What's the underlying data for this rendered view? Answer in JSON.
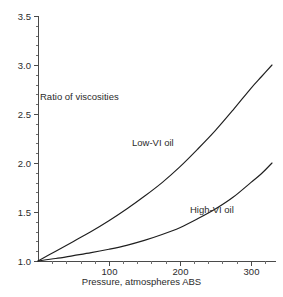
{
  "chart_data": {
    "type": "line",
    "title": "",
    "subtitle": "",
    "xlabel": "Pressure, atmospheres ABS",
    "ylabel": "Ratio of viscosities",
    "xlim": [
      0,
      330
    ],
    "ylim": [
      1.0,
      3.5
    ],
    "grid": false,
    "legend_position": "inline-annotations",
    "x_ticks": [
      100,
      200,
      300
    ],
    "x_tick_labels": [
      "100",
      "200",
      "300"
    ],
    "x_minor_tick_step": 20,
    "y_ticks": [
      1.0,
      1.5,
      2.0,
      2.5,
      3.0,
      3.5
    ],
    "y_tick_labels": [
      "1.0",
      "1.5",
      "2.0",
      "2.5",
      "3.0",
      "3.5"
    ],
    "y_minor_tick_step": 0.1,
    "series": [
      {
        "name": "Low-VI oil",
        "label": "Low-VI oil",
        "color": "#1f1f1f",
        "x": [
          0,
          25,
          50,
          75,
          100,
          125,
          150,
          175,
          200,
          225,
          250,
          275,
          300,
          315,
          330
        ],
        "values": [
          1.0,
          1.1,
          1.2,
          1.3,
          1.41,
          1.53,
          1.66,
          1.8,
          1.96,
          2.14,
          2.33,
          2.54,
          2.76,
          2.88,
          3.0
        ]
      },
      {
        "name": "High-VI oil",
        "label": "High-VI oil",
        "color": "#1f1f1f",
        "x": [
          0,
          25,
          50,
          75,
          100,
          125,
          150,
          175,
          200,
          225,
          250,
          275,
          300,
          315,
          330
        ],
        "values": [
          1.0,
          1.025,
          1.055,
          1.085,
          1.12,
          1.16,
          1.21,
          1.27,
          1.34,
          1.43,
          1.53,
          1.65,
          1.8,
          1.89,
          2.0
        ]
      }
    ],
    "annotations": [
      {
        "name": "ratio-of-viscosities",
        "text": "Ratio of viscosities"
      },
      {
        "name": "low-vi-oil",
        "text": "Low-VI oil"
      },
      {
        "name": "high-vi-oil",
        "text": "High-VI oil"
      }
    ],
    "colors": {
      "background": "#ffffff",
      "axis": "#4a4a4a",
      "curve": "#1f1f1f",
      "text": "#2b2b2b"
    }
  }
}
